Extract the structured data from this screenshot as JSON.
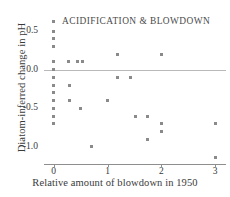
{
  "chart_data": {
    "type": "scatter",
    "title": "ACIDIFICATION & BLOWDOWN",
    "xlabel": "Relative amount of blowdown in 1950",
    "ylabel": "Diatom-inferred change in pH",
    "xlim": [
      -0.18,
      3.2
    ],
    "ylim": [
      -1.22,
      0.72
    ],
    "xticks": [
      0,
      1,
      2,
      3
    ],
    "xticklabels": [
      "0",
      "1",
      "2",
      "3"
    ],
    "yticks": [
      0.5,
      0.0,
      -0.5,
      -1.0
    ],
    "yticklabels": [
      "0.5",
      "0.0",
      "-0.5",
      "-1.0"
    ],
    "grid": false,
    "legend": null,
    "reference_lines": [
      {
        "axis": "y",
        "value": 0.0,
        "color": "#b9b9b9"
      }
    ],
    "marker": {
      "shape": "square",
      "color": "#8a8a8a",
      "size": 3
    },
    "points": [
      {
        "x": 0.0,
        "y": 0.62
      },
      {
        "x": 0.0,
        "y": 0.5
      },
      {
        "x": 0.0,
        "y": 0.4
      },
      {
        "x": 0.0,
        "y": 0.3
      },
      {
        "x": 0.0,
        "y": 0.1
      },
      {
        "x": 0.0,
        "y": 0.0
      },
      {
        "x": 0.0,
        "y": -0.1
      },
      {
        "x": 0.0,
        "y": -0.2
      },
      {
        "x": 0.0,
        "y": -0.3
      },
      {
        "x": 0.0,
        "y": -0.4
      },
      {
        "x": 0.0,
        "y": -0.5
      },
      {
        "x": 0.0,
        "y": -0.6
      },
      {
        "x": 0.0,
        "y": -0.7
      },
      {
        "x": 0.28,
        "y": 0.1
      },
      {
        "x": 0.3,
        "y": -0.2
      },
      {
        "x": 0.3,
        "y": -0.4
      },
      {
        "x": 0.45,
        "y": 0.1
      },
      {
        "x": 0.53,
        "y": 0.1
      },
      {
        "x": 0.5,
        "y": -0.5
      },
      {
        "x": 0.7,
        "y": -1.0
      },
      {
        "x": 1.0,
        "y": -0.4
      },
      {
        "x": 1.18,
        "y": 0.2
      },
      {
        "x": 1.18,
        "y": -0.1
      },
      {
        "x": 1.42,
        "y": -0.1
      },
      {
        "x": 1.52,
        "y": -0.6
      },
      {
        "x": 1.75,
        "y": -0.6
      },
      {
        "x": 1.75,
        "y": -0.9
      },
      {
        "x": 2.0,
        "y": 0.2
      },
      {
        "x": 2.0,
        "y": -0.7
      },
      {
        "x": 2.0,
        "y": -0.8
      },
      {
        "x": 3.0,
        "y": -0.7
      },
      {
        "x": 3.0,
        "y": -1.13
      }
    ]
  }
}
